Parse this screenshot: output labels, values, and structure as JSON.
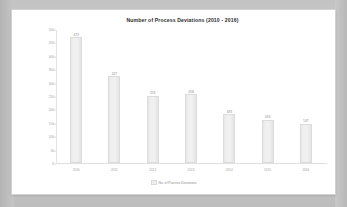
{
  "chart_data": {
    "type": "bar",
    "title": "Number of Process Deviations  (2010 - 2016)",
    "categories": [
      "2010",
      "2011",
      "2012",
      "2013",
      "2014",
      "2015",
      "2016"
    ],
    "values": [
      473,
      327,
      253,
      258,
      183,
      163,
      147
    ],
    "series": [
      {
        "name": "No. of Process Deviations",
        "values": [
          473,
          327,
          253,
          258,
          183,
          163,
          147
        ]
      }
    ],
    "xlabel": "",
    "ylabel": "",
    "ylim": [
      0,
      500
    ],
    "yticks": [
      0,
      50,
      100,
      150,
      200,
      250,
      300,
      350,
      400,
      450,
      500
    ],
    "grid": false,
    "legend_position": "bottom",
    "legend_entries": [
      "No. of Process Deviations"
    ],
    "bar_color": "#ededed",
    "bar_border_color": "#dcdcdc"
  },
  "panel": {
    "background": "#ffffff",
    "border_color": "#d2d2d2"
  },
  "backdrop": {
    "color": "#c9c9c9"
  },
  "icons": {
    "legend_swatch": "bar-swatch-icon"
  }
}
